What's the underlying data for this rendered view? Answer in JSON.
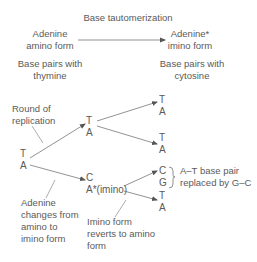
{
  "title": "Base tautomerization",
  "left_form": {
    "line1": "Adenine",
    "line2": "amino form"
  },
  "right_form": {
    "line1": "Adenine*",
    "line2": "imino form"
  },
  "left_pairs": {
    "line1": "Base pairs with",
    "line2": "thymine"
  },
  "right_pairs": {
    "line1": "Base pairs with",
    "line2": "cytosine"
  },
  "annotations": {
    "round": {
      "line1": "Round of",
      "line2": "replication"
    },
    "adenine_changes": {
      "line1": "Adenine",
      "line2": "changes from",
      "line3": "amino to",
      "line4": "imino form"
    },
    "imino_reverts": {
      "line1": "Imino form",
      "line2": "reverts to amino",
      "line3": "form"
    },
    "replaced": {
      "line1": "A–T base pair",
      "line2": "replaced by G–C"
    }
  },
  "nodes": {
    "root": {
      "top": "T",
      "bottom": "A"
    },
    "gen1_top": {
      "top": "T",
      "bottom": "A"
    },
    "gen1_bottom": {
      "top": "C",
      "bottom": "A*(imino)"
    },
    "gen2_1": {
      "top": "T",
      "bottom": "A"
    },
    "gen2_2": {
      "top": "T",
      "bottom": "A"
    },
    "gen2_3": {
      "top": "C",
      "bottom": "G"
    },
    "gen2_4": {
      "top": "T",
      "bottom": "A"
    }
  },
  "colors": {
    "text": "#5a5a5a",
    "line": "#7a7a7a"
  }
}
